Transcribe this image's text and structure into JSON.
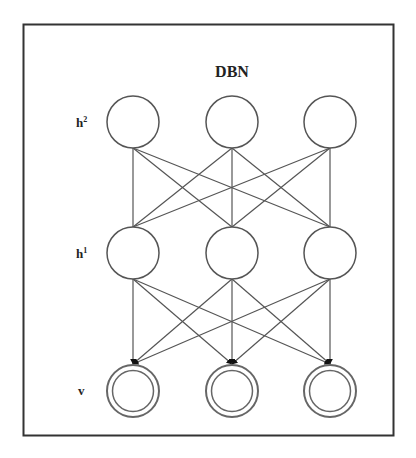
{
  "diagram": {
    "title": "DBN",
    "layers": [
      {
        "id": "h2",
        "label": "h",
        "superscript": "2",
        "y": 122,
        "style": "single",
        "nodes": [
          133,
          232,
          330
        ]
      },
      {
        "id": "h1",
        "label": "h",
        "superscript": "1",
        "y": 253,
        "style": "single",
        "nodes": [
          133,
          232,
          330
        ]
      },
      {
        "id": "v",
        "label": "v",
        "superscript": "",
        "y": 391,
        "style": "double",
        "nodes": [
          133,
          232,
          330
        ]
      }
    ],
    "connections": [
      {
        "from": "h2",
        "to": "h1",
        "type": "undirected",
        "pattern": "fully-connected"
      },
      {
        "from": "h1",
        "to": "v",
        "type": "directed",
        "pattern": "fully-connected"
      }
    ],
    "colors": {
      "stroke": "#555555",
      "frame": "#333333",
      "arrow": "#111111",
      "background": "#ffffff"
    }
  }
}
